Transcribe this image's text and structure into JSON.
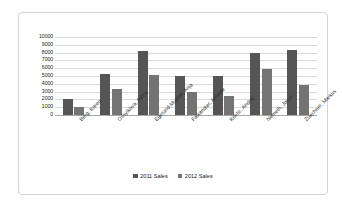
{
  "chart_data": {
    "type": "bar",
    "title": "",
    "xlabel": "",
    "ylabel": "",
    "ylim": [
      0,
      10000
    ],
    "ytick_step": 1000,
    "grid": true,
    "legend_position": "bottom",
    "categories": [
      "Berg, Karen",
      "Ovsyikova, Petra",
      "Egelund-Mueller, Anja",
      "Falxandier, Antoine",
      "Kostic, Andrej",
      "Nemeth, Jorun",
      "Zuechner, Markus"
    ],
    "ytick_labels": [
      "10000",
      "9000",
      "8000",
      "7000",
      "6000",
      "5000",
      "4000",
      "3000",
      "2000",
      "1000",
      "0"
    ],
    "series": [
      {
        "name": "2011 Sales",
        "color": "#555555",
        "values": [
          2000,
          5200,
          8200,
          5000,
          5000,
          8000,
          8300
        ]
      },
      {
        "name": "2012 Sales",
        "color": "#737373",
        "values": [
          1000,
          3300,
          5100,
          2900,
          2400,
          5900,
          3900
        ]
      }
    ]
  },
  "frame": {
    "border_color": "#d4d4d4",
    "background": "#ffffff"
  }
}
